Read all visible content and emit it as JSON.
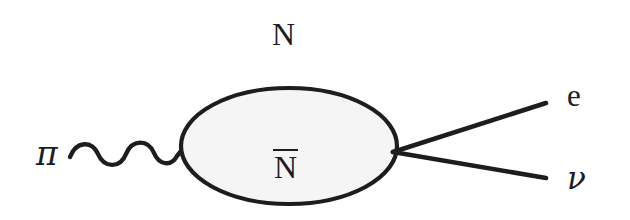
{
  "figure": {
    "kind": "feynman-diagram",
    "background_color": "#ffffff",
    "ink_color": "#1d1d1f",
    "blob_fill_color": "#f5f5f6"
  },
  "labels": {
    "incoming_particle": "π",
    "blob_top": "N",
    "blob_inside": "N",
    "blob_inside_has_overbar": true,
    "outgoing_upper": "e",
    "outgoing_lower": "ν"
  },
  "elements": {
    "wavy_line_name": "pion-wavy-propagator",
    "blob_name": "nucleon-antinucleon-blob",
    "upper_leg_name": "electron-line",
    "lower_leg_name": "neutrino-line"
  },
  "geometry": {
    "blob_center_x": 289,
    "blob_center_y": 146,
    "blob_radius_x": 108,
    "blob_radius_y": 58,
    "wave_start_x": 70,
    "wave_end_x": 182,
    "wave_baseline_y": 152,
    "vertex_x": 397,
    "vertex_y": 152,
    "upper_leg_end_x": 546,
    "upper_leg_end_y": 103,
    "lower_leg_end_x": 546,
    "lower_leg_end_y": 178
  }
}
